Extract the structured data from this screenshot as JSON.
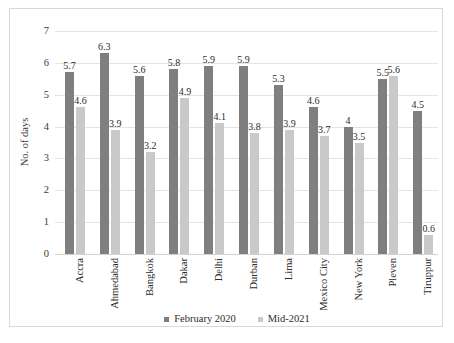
{
  "chart_data": {
    "type": "bar",
    "title": "",
    "xlabel": "",
    "ylabel": "No. of days",
    "ylim": [
      0,
      7
    ],
    "ytick_step": 1,
    "yticks": [
      "7",
      "6",
      "5",
      "4",
      "3",
      "2",
      "1",
      "0"
    ],
    "grid": true,
    "legend_position": "bottom-center",
    "categories": [
      "Accra",
      "Ahmedabad",
      "Bangkok",
      "Dakar",
      "Delhi",
      "Durban",
      "Lima",
      "Mexico City",
      "New York",
      "Pleven",
      "Tiruppur"
    ],
    "series": [
      {
        "name": "February 2020",
        "color": "#7f7f7f",
        "values": [
          5.7,
          6.3,
          5.6,
          5.8,
          5.9,
          5.9,
          5.3,
          4.6,
          4,
          5.5,
          4.5
        ],
        "labels": [
          "5.7",
          "6.3",
          "5.6",
          "5.8",
          "5.9",
          "5.9",
          "5.3",
          "4.6",
          "4",
          "5.5",
          "4.5"
        ]
      },
      {
        "name": "Mid-2021",
        "color": "#c9c9c9",
        "values": [
          4.6,
          3.9,
          3.2,
          4.9,
          4.1,
          3.8,
          3.9,
          3.7,
          3.5,
          5.6,
          0.6
        ],
        "labels": [
          "4.6",
          "3.9",
          "3.2",
          "4.9",
          "4.1",
          "3.8",
          "3.9",
          "3.7",
          "3.5",
          "5.6",
          "0.6"
        ]
      }
    ]
  },
  "legend": [
    {
      "label": "February 2020",
      "color": "#7f7f7f"
    },
    {
      "label": "Mid-2021",
      "color": "#c9c9c9"
    }
  ]
}
